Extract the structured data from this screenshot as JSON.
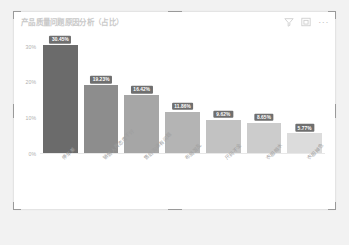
{
  "card": {
    "title": "产品质量问题原因分析（占比）",
    "tools": [
      {
        "name": "filter-icon",
        "label": "筛选器"
      },
      {
        "name": "focus-mode-icon",
        "label": "聚焦模式"
      },
      {
        "name": "more-options-icon",
        "label": "更多选项"
      }
    ],
    "more_glyph": "···"
  },
  "chart_data": {
    "type": "bar",
    "title": "产品质量问题原因分析（占比）",
    "xlabel": "",
    "ylabel": "",
    "ylim": [
      0,
      33
    ],
    "grid": false,
    "legend": "none",
    "yticks": [
      "0%",
      "10%",
      "20%",
      "30%"
    ],
    "ytick_values": [
      0,
      10,
      20,
      30
    ],
    "categories": [
      "停车差",
      "销售人员态度不好",
      "售后沟通有问题",
      "布局混乱",
      "尺码不全",
      "衣服缩水",
      "衣服掉色"
    ],
    "values": [
      30.45,
      19.23,
      16.42,
      11.86,
      9.62,
      8.65,
      5.77
    ],
    "data_labels": [
      "30.45%",
      "19.23%",
      "16.42%",
      "11.86%",
      "9.62%",
      "8.65%",
      "5.77%"
    ],
    "bar_colors": [
      "#6b6b6b",
      "#8d8d8d",
      "#a6a6a6",
      "#b4b4b4",
      "#c2c2c2",
      "#cccccc",
      "#dcdcdc"
    ],
    "label_background": "#6f6f6f",
    "label_color": "#ffffff"
  }
}
